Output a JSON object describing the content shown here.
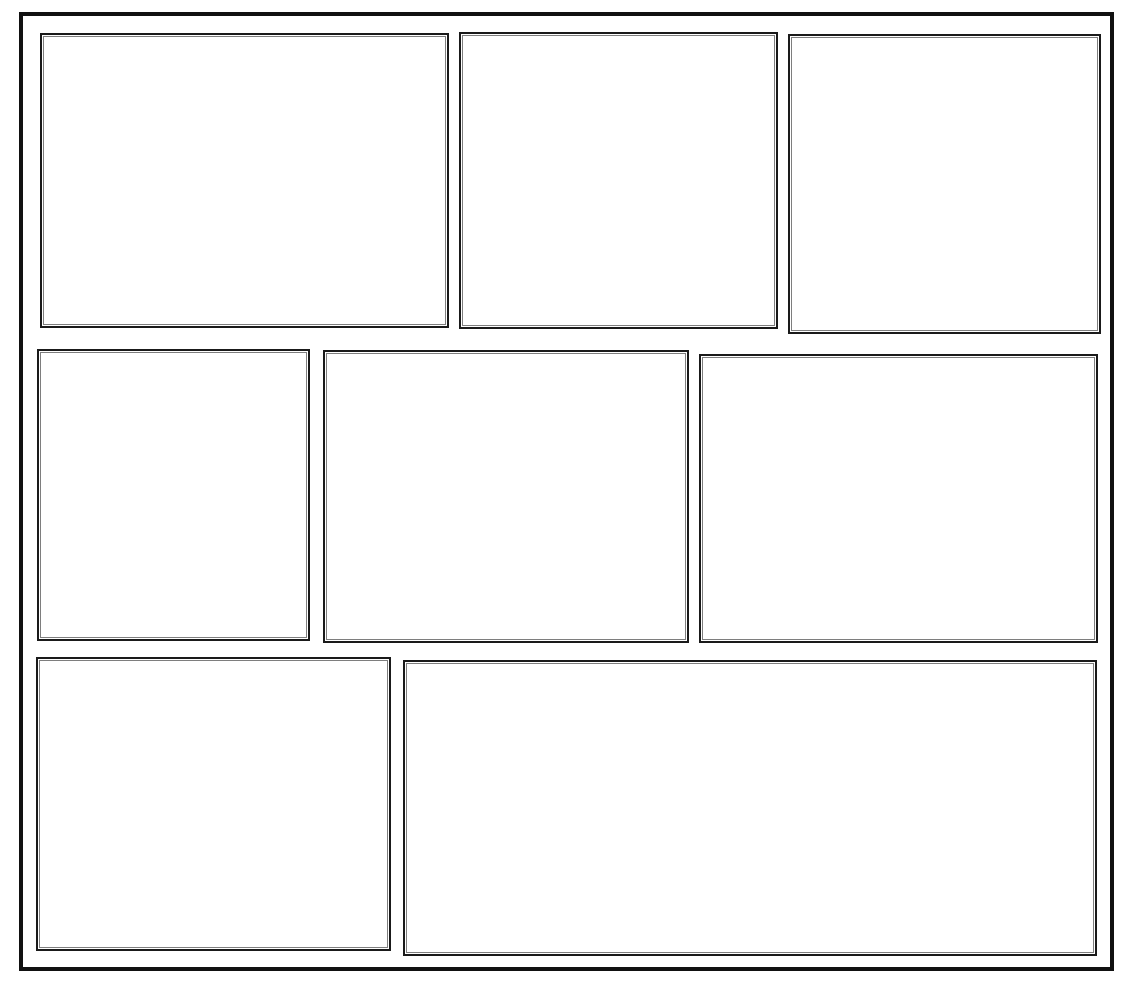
{
  "document": {
    "kind": "blank-comic-page-template",
    "title": "",
    "page_number": "",
    "background_color": "#ffffff",
    "ink_color": "#111111",
    "border_color": "#1a1a1a"
  },
  "page_frame": {
    "label": "",
    "border_width_px": 4
  },
  "layout": {
    "rows": 3,
    "panel_count": 8,
    "gutter_color": "#ffffff"
  },
  "panels": [
    {
      "id": "panel-1",
      "label": "",
      "row": 1,
      "order": 1,
      "content": ""
    },
    {
      "id": "panel-2",
      "label": "",
      "row": 1,
      "order": 2,
      "content": ""
    },
    {
      "id": "panel-3",
      "label": "",
      "row": 1,
      "order": 3,
      "content": ""
    },
    {
      "id": "panel-4",
      "label": "",
      "row": 2,
      "order": 1,
      "content": ""
    },
    {
      "id": "panel-5",
      "label": "",
      "row": 2,
      "order": 2,
      "content": ""
    },
    {
      "id": "panel-6",
      "label": "",
      "row": 2,
      "order": 3,
      "content": ""
    },
    {
      "id": "panel-7",
      "label": "",
      "row": 3,
      "order": 1,
      "content": ""
    },
    {
      "id": "panel-8",
      "label": "",
      "row": 3,
      "order": 2,
      "content": ""
    }
  ]
}
